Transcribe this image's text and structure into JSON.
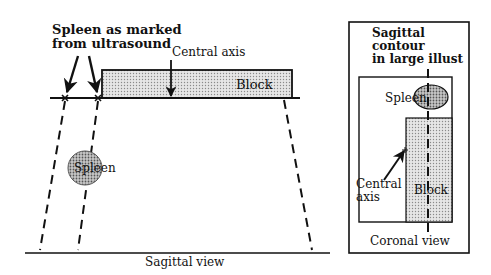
{
  "sagittal": {
    "spleen_marked_label_line1": "Spleen as marked",
    "spleen_marked_label_line2": "from ultrasound",
    "central_axis_label": "Central axis",
    "block_label": "Block",
    "spleen_label": "Spleen",
    "view_label": "Sagittal view"
  },
  "coronal": {
    "contour_label_line1": "Sagittal",
    "contour_label_line2": "contour",
    "contour_label_line3": "in large illust",
    "spleen_label": "Spleen",
    "central_axis_label_line1": "Central",
    "central_axis_label_line2": "axis",
    "block_label": "Block",
    "view_label": "Coronal view"
  },
  "colors": {
    "stroke": "#111111",
    "block_fill": "#d9d9d9",
    "spleen_fill": "#bdbdbd"
  }
}
